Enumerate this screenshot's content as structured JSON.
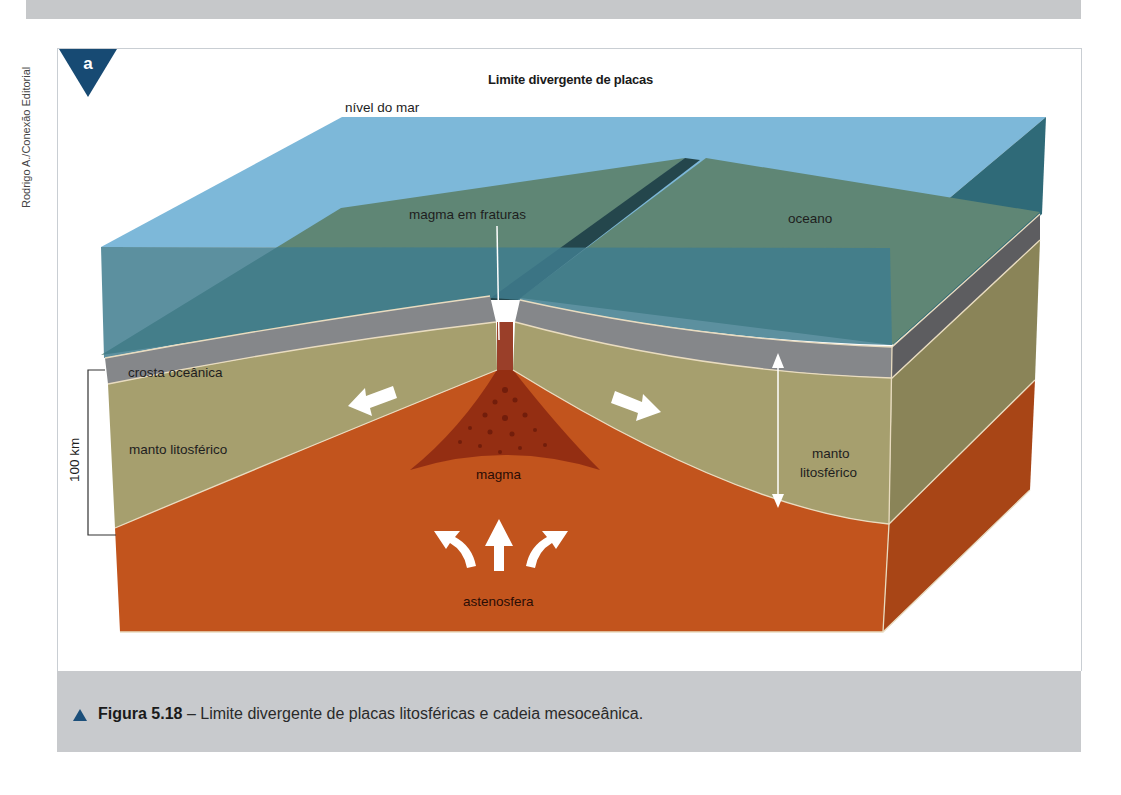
{
  "page": {
    "credit": "Rodrigo A./Conexão Editorial",
    "panel_letter": "a",
    "colors": {
      "badge": "#174a73",
      "sea_surface": "#7db8d9",
      "ocean_water": "#3f7d8e",
      "seafloor": "#5f8675",
      "oceanic_crust": "#85878a",
      "lithospheric_mantle": "#a69f6e",
      "asthenosphere": "#c2541d",
      "magma": "#8f2a12",
      "caption_band": "#c8cacd"
    }
  },
  "diagram": {
    "title": "Limite divergente de placas",
    "labels": {
      "sea_level": "nível do mar",
      "magma_fractures": "magma em fraturas",
      "ocean": "oceano",
      "oceanic_crust": "crosta oceânica",
      "lithospheric_mantle_left": "manto litosférico",
      "lithospheric_mantle_right_line1": "manto",
      "lithospheric_mantle_right_line2": "litosférico",
      "magma": "magma",
      "asthenosphere": "astenosfera",
      "scale": "100 km"
    },
    "arrows": [
      "divergence-left-arrow",
      "divergence-right-arrow",
      "upwelling-left-arrow",
      "upwelling-up-arrow",
      "upwelling-right-arrow",
      "thickness-double-arrow"
    ]
  },
  "caption": {
    "figure_number": "Figura 5.18",
    "separator": " – ",
    "text": "Limite divergente de placas litosféricas e cadeia mesoceânica."
  }
}
